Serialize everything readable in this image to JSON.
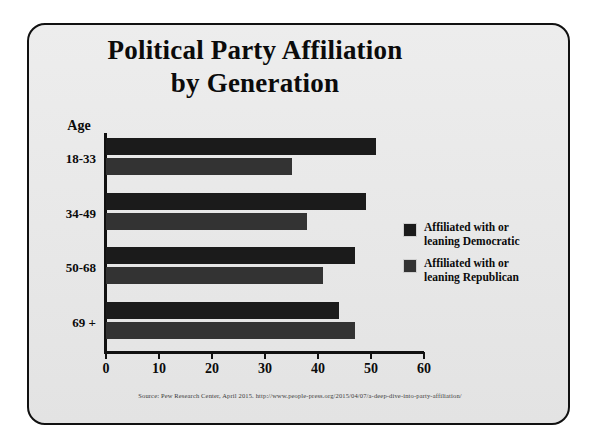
{
  "chart_data": {
    "type": "bar",
    "orientation": "horizontal",
    "title": "Political Party Affiliation by Generation",
    "title_lines": [
      "Political Party Affiliation",
      "by Generation"
    ],
    "categories": [
      "18-33",
      "34-49",
      "50-68",
      "69 +"
    ],
    "ylabel": "Age",
    "xlabel": "",
    "xlim": [
      0,
      60
    ],
    "xticks": [
      0,
      10,
      20,
      30,
      40,
      50,
      60
    ],
    "xtick_labels": [
      "0",
      "10",
      "20",
      "30",
      "40",
      "50",
      "60"
    ],
    "grid": false,
    "legend_position": "right",
    "series": [
      {
        "name": "Affiliated with or leaning Democratic",
        "name_lines": [
          "Affiliated with or",
          "leaning Democratic"
        ],
        "color": "#1b1b1b",
        "values": [
          51,
          49,
          47,
          44
        ]
      },
      {
        "name": "Affiliated with or leaning Republican",
        "name_lines": [
          "Affiliated with or",
          "leaning Republican"
        ],
        "color": "#333333",
        "values": [
          35,
          38,
          41,
          47
        ]
      }
    ],
    "source": "Source: Pew Research Center, April 2015. http://www.people-press.org/2015/04/07/a-deep-dive-into-party-affiliation/"
  },
  "colors": {
    "democratic": "#1b1b1b",
    "republican": "#333333",
    "frame": "#111111",
    "panel": "#e9e9e9",
    "text": "#0b0b0b"
  }
}
